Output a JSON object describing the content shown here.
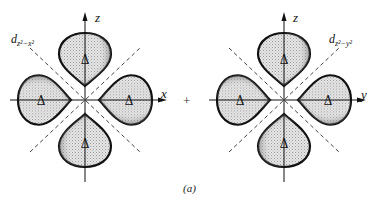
{
  "figure": {
    "caption": "(a)",
    "operator": "+",
    "colors": {
      "lobe_fill": "#d8d8d8",
      "lobe_edge": "#111111",
      "axis": "#111111",
      "node_line": "#444444"
    },
    "panels": [
      {
        "id": "left",
        "orbital_label": "d",
        "orbital_subscript": "z²−x²",
        "vertical_axis": "z",
        "horizontal_axis": "x",
        "lobe_symbol": "Δ",
        "lobe_count": 4
      },
      {
        "id": "right",
        "orbital_label": "d",
        "orbital_subscript": "z²−y²",
        "vertical_axis": "z",
        "horizontal_axis": "y",
        "lobe_symbol": "Δ",
        "lobe_count": 4
      }
    ]
  }
}
